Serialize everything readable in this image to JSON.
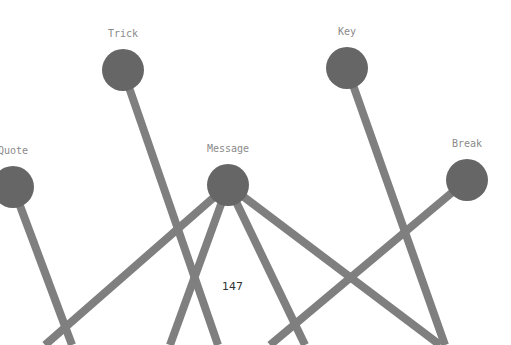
{
  "diagram": {
    "type": "network-graph",
    "nodes": [
      {
        "id": "trick",
        "label": "Trick"
      },
      {
        "id": "key",
        "label": "Key"
      },
      {
        "id": "quote",
        "label": "Quote"
      },
      {
        "id": "message",
        "label": "Message"
      },
      {
        "id": "break",
        "label": "Break"
      }
    ],
    "edges": [
      {
        "from": "trick",
        "to": "offscreen-bottom"
      },
      {
        "from": "key",
        "to": "offscreen-bottom"
      },
      {
        "from": "quote",
        "to": "offscreen-bottom"
      },
      {
        "from": "break",
        "to": "offscreen-bottom"
      },
      {
        "from": "message",
        "to": "offscreen-bottom"
      },
      {
        "from": "message",
        "to": "offscreen-bottom"
      },
      {
        "from": "message",
        "to": "offscreen-bottom"
      },
      {
        "from": "message",
        "to": "offscreen-bottom"
      }
    ],
    "colors": {
      "node": "#666666",
      "edge": "#7f7f7f",
      "label": "#8a8a8a"
    }
  },
  "page_number": "147"
}
